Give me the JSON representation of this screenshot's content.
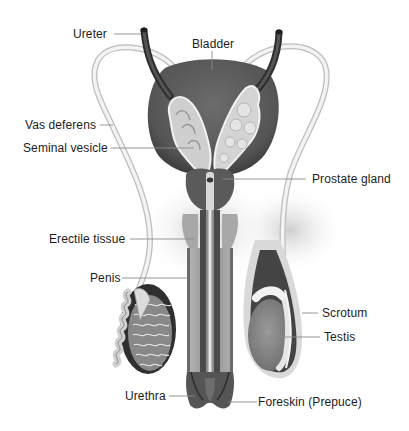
{
  "diagram": {
    "labels": {
      "ureter": "Ureter",
      "bladder": "Bladder",
      "vas_deferens": "Vas deferens",
      "seminal_vesicle": "Seminal vesicle",
      "prostate_gland": "Prostate gland",
      "erectile_tissue": "Erectile tissue",
      "penis": "Penis",
      "scrotum": "Scrotum",
      "testis": "Testis",
      "urethra": "Urethra",
      "foreskin": "Foreskin (Prepuce)"
    },
    "colors": {
      "background": "#ffffff",
      "bladder": "#5e5e5e",
      "ureter": "#3e3e3e",
      "vas_deferens": "#ededed",
      "seminal_vesicle": "#cfcfcf",
      "prostate": "#5a5a5a",
      "erectile_tissue": "#9a9a9a",
      "shaft_dark": "#4a4a4a",
      "scrotum": "#d9d9d9",
      "testis": "#8c8c8c",
      "leader_line": "#8a8a8a",
      "label_text": "#1c1c1c"
    }
  }
}
